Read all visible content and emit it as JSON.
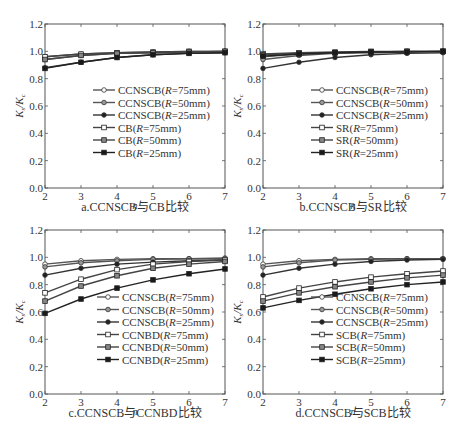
{
  "y_axis_label": "Ks/Kc",
  "x_axis_label": "n",
  "x_ticks": [
    2,
    3,
    4,
    5,
    6,
    7
  ],
  "y_ticks": [
    "0.0",
    "0.2",
    "0.4",
    "0.6",
    "0.8",
    "1.0",
    "1.2"
  ],
  "panels": [
    {
      "caption": "a.CCNSCB与CB比较"
    },
    {
      "caption": "b.CCNSCB与SR比较"
    },
    {
      "caption": "c.CCNSCB与CCNBD比较"
    },
    {
      "caption": "d.CCNSCB与SCB比较"
    }
  ],
  "chart_data": [
    {
      "type": "line",
      "title": "a.CCNSCB与CB比较",
      "xlabel": "n",
      "ylabel": "Ks/Kc",
      "xlim": [
        2,
        7
      ],
      "ylim": [
        0,
        1.2
      ],
      "grid": false,
      "legend_position": "center-right",
      "x": [
        2,
        3,
        4,
        5,
        6,
        7
      ],
      "series": [
        {
          "name": "CCNSCB(R=75mm)",
          "marker": "circle-open",
          "values": [
            0.96,
            0.98,
            0.99,
            0.995,
            1.0,
            1.0
          ]
        },
        {
          "name": "CCNSCB(R=50mm)",
          "marker": "circle-gray",
          "values": [
            0.94,
            0.97,
            0.985,
            0.99,
            0.995,
            1.0
          ]
        },
        {
          "name": "CCNSCB(R=25mm)",
          "marker": "circle-filled",
          "values": [
            0.88,
            0.92,
            0.955,
            0.975,
            0.985,
            0.99
          ]
        },
        {
          "name": "CB(R=75mm)",
          "marker": "square-open",
          "values": [
            0.96,
            0.98,
            0.99,
            0.995,
            1.0,
            1.0
          ]
        },
        {
          "name": "CB(R=50mm)",
          "marker": "square-gray",
          "values": [
            0.94,
            0.97,
            0.985,
            0.99,
            0.995,
            1.0
          ]
        },
        {
          "name": "CB(R=25mm)",
          "marker": "square-filled",
          "values": [
            0.875,
            0.92,
            0.955,
            0.975,
            0.985,
            0.99
          ]
        }
      ]
    },
    {
      "type": "line",
      "title": "b.CCNSCB与SR比较",
      "xlabel": "n",
      "ylabel": "Ks/Kc",
      "xlim": [
        2,
        7
      ],
      "ylim": [
        0,
        1.2
      ],
      "grid": false,
      "legend_position": "center-right",
      "x": [
        2,
        3,
        4,
        5,
        6,
        7
      ],
      "series": [
        {
          "name": "CCNSCB(R=75mm)",
          "marker": "circle-open",
          "values": [
            0.96,
            0.98,
            0.99,
            0.995,
            1.0,
            1.0
          ]
        },
        {
          "name": "CCNSCB(R=50mm)",
          "marker": "circle-gray",
          "values": [
            0.94,
            0.97,
            0.985,
            0.99,
            0.995,
            1.0
          ]
        },
        {
          "name": "CCNSCB(R=25mm)",
          "marker": "circle-filled",
          "values": [
            0.875,
            0.92,
            0.955,
            0.975,
            0.985,
            0.99
          ]
        },
        {
          "name": "SR(R=75mm)",
          "marker": "square-open",
          "values": [
            0.98,
            0.99,
            0.995,
            1.0,
            1.0,
            1.0
          ]
        },
        {
          "name": "SR(R=50mm)",
          "marker": "square-gray",
          "values": [
            0.975,
            0.985,
            0.99,
            0.995,
            1.0,
            1.0
          ]
        },
        {
          "name": "SR(R=25mm)",
          "marker": "square-filled",
          "values": [
            0.965,
            0.98,
            0.99,
            0.995,
            0.995,
            1.0
          ]
        }
      ]
    },
    {
      "type": "line",
      "title": "c.CCNSCB与CCNBD比较",
      "xlabel": "n",
      "ylabel": "Ks/Kc",
      "xlim": [
        2,
        7
      ],
      "ylim": [
        0,
        1.2
      ],
      "grid": false,
      "legend_position": "center-right",
      "x": [
        2,
        3,
        4,
        5,
        6,
        7
      ],
      "series": [
        {
          "name": "CCNSCB(R=75mm)",
          "marker": "circle-open",
          "values": [
            0.95,
            0.975,
            0.985,
            0.99,
            0.99,
            0.995
          ]
        },
        {
          "name": "CCNSCB(R=50mm)",
          "marker": "circle-gray",
          "values": [
            0.93,
            0.96,
            0.975,
            0.985,
            0.99,
            0.99
          ]
        },
        {
          "name": "CCNSCB(R=25mm)",
          "marker": "circle-filled",
          "values": [
            0.87,
            0.92,
            0.95,
            0.965,
            0.975,
            0.98
          ]
        },
        {
          "name": "CCNBD(R=75mm)",
          "marker": "square-open",
          "values": [
            0.74,
            0.84,
            0.91,
            0.95,
            0.97,
            0.98
          ]
        },
        {
          "name": "CCNBD(R=50mm)",
          "marker": "square-gray",
          "values": [
            0.68,
            0.79,
            0.865,
            0.92,
            0.95,
            0.97
          ]
        },
        {
          "name": "CCNBD(R=25mm)",
          "marker": "square-filled",
          "values": [
            0.59,
            0.695,
            0.775,
            0.835,
            0.88,
            0.915
          ]
        }
      ]
    },
    {
      "type": "line",
      "title": "d.CCNSCB与SCB比较",
      "xlabel": "n",
      "ylabel": "Ks/Kc",
      "xlim": [
        2,
        7
      ],
      "ylim": [
        0,
        1.2
      ],
      "grid": false,
      "legend_position": "center-right",
      "x": [
        2,
        3,
        4,
        5,
        6,
        7
      ],
      "series": [
        {
          "name": "CCNSCB(R=75mm)",
          "marker": "circle-open",
          "values": [
            0.95,
            0.975,
            0.985,
            0.99,
            0.99,
            0.99
          ]
        },
        {
          "name": "CCNSCB(R=50mm)",
          "marker": "circle-gray",
          "values": [
            0.93,
            0.96,
            0.98,
            0.985,
            0.99,
            0.99
          ]
        },
        {
          "name": "CCNSCB(R=25mm)",
          "marker": "circle-filled",
          "values": [
            0.87,
            0.92,
            0.95,
            0.97,
            0.98,
            0.985
          ]
        },
        {
          "name": "SCB(R=75mm)",
          "marker": "square-open",
          "values": [
            0.71,
            0.775,
            0.82,
            0.855,
            0.88,
            0.9
          ]
        },
        {
          "name": "SCB(R=50mm)",
          "marker": "square-gray",
          "values": [
            0.68,
            0.74,
            0.785,
            0.82,
            0.85,
            0.87
          ]
        },
        {
          "name": "SCB(R=25mm)",
          "marker": "square-filled",
          "values": [
            0.63,
            0.685,
            0.73,
            0.77,
            0.8,
            0.82
          ]
        }
      ]
    }
  ]
}
